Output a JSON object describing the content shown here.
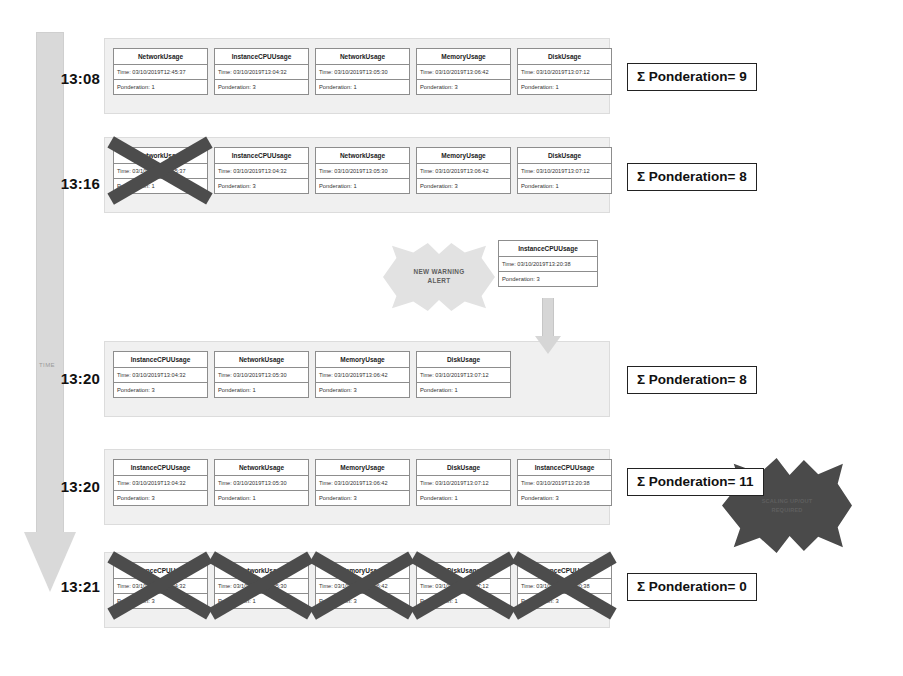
{
  "diagram": {
    "axis": {
      "label": "TIME",
      "ticks": [
        "13:08",
        "13:16",
        "13:20",
        "13:20",
        "13:21"
      ]
    },
    "alert": {
      "warning_label": "NEW WARNING\nALERT",
      "warning_line1": "NEW WARNING",
      "warning_line2": "ALERT",
      "scaling_line1": "SCALING UP/OUT",
      "scaling_line2": "REQUIRED"
    },
    "incoming_event": {
      "title": "InstanceCPUUsage",
      "time": "Time: 03/10/2019T13:20:38",
      "ponderation": "Ponderation: 3"
    },
    "rows": [
      {
        "time": "13:08",
        "sum_label": "Σ Ponderation= 9",
        "cards": [
          {
            "title": "NetworkUsage",
            "time": "Time: 03/10/2019T12:45:37",
            "ponderation": "Ponderation: 1",
            "crossed": false
          },
          {
            "title": "InstanceCPUUsage",
            "time": "Time: 03/10/2019T13:04:32",
            "ponderation": "Ponderation: 3",
            "crossed": false
          },
          {
            "title": "NetworkUsage",
            "time": "Time: 03/10/2019T13:05:30",
            "ponderation": "Ponderation: 1",
            "crossed": false
          },
          {
            "title": "MemoryUsage",
            "time": "Time: 03/10/2019T13:06:42",
            "ponderation": "Ponderation: 3",
            "crossed": false
          },
          {
            "title": "DiskUsage",
            "time": "Time: 03/10/2019T13:07:12",
            "ponderation": "Ponderation: 1",
            "crossed": false
          }
        ]
      },
      {
        "time": "13:16",
        "sum_label": "Σ Ponderation= 8",
        "cards": [
          {
            "title": "NetworkUsage",
            "time": "Time: 03/10/2019T12:45:37",
            "ponderation": "Ponderation: 1",
            "crossed": true
          },
          {
            "title": "InstanceCPUUsage",
            "time": "Time: 03/10/2019T13:04:32",
            "ponderation": "Ponderation: 3",
            "crossed": false
          },
          {
            "title": "NetworkUsage",
            "time": "Time: 03/10/2019T13:05:30",
            "ponderation": "Ponderation: 1",
            "crossed": false
          },
          {
            "title": "MemoryUsage",
            "time": "Time: 03/10/2019T13:06:42",
            "ponderation": "Ponderation: 3",
            "crossed": false
          },
          {
            "title": "DiskUsage",
            "time": "Time: 03/10/2019T13:07:12",
            "ponderation": "Ponderation: 1",
            "crossed": false
          }
        ]
      },
      {
        "time": "13:20",
        "sum_label": "Σ Ponderation= 8",
        "cards": [
          {
            "title": "InstanceCPUUsage",
            "time": "Time: 03/10/2019T13:04:32",
            "ponderation": "Ponderation: 3",
            "crossed": false
          },
          {
            "title": "NetworkUsage",
            "time": "Time: 03/10/2019T13:05:30",
            "ponderation": "Ponderation: 1",
            "crossed": false
          },
          {
            "title": "MemoryUsage",
            "time": "Time: 03/10/2019T13:06:42",
            "ponderation": "Ponderation: 3",
            "crossed": false
          },
          {
            "title": "DiskUsage",
            "time": "Time: 03/10/2019T13:07:12",
            "ponderation": "Ponderation: 1",
            "crossed": false
          }
        ]
      },
      {
        "time": "13:20",
        "sum_label": "Σ Ponderation= 11",
        "cards": [
          {
            "title": "InstanceCPUUsage",
            "time": "Time: 03/10/2019T13:04:32",
            "ponderation": "Ponderation: 3",
            "crossed": false
          },
          {
            "title": "NetworkUsage",
            "time": "Time: 03/10/2019T13:05:30",
            "ponderation": "Ponderation: 1",
            "crossed": false
          },
          {
            "title": "MemoryUsage",
            "time": "Time: 03/10/2019T13:06:42",
            "ponderation": "Ponderation: 3",
            "crossed": false
          },
          {
            "title": "DiskUsage",
            "time": "Time: 03/10/2019T13:07:12",
            "ponderation": "Ponderation: 1",
            "crossed": false
          },
          {
            "title": "InstanceCPUUsage",
            "time": "Time: 03/10/2019T13:20:38",
            "ponderation": "Ponderation: 3",
            "crossed": false
          }
        ]
      },
      {
        "time": "13:21",
        "sum_label": "Σ Ponderation= 0",
        "cards": [
          {
            "title": "InstanceCPUUsage",
            "time": "Time: 03/10/2019T13:04:32",
            "ponderation": "Ponderation: 3",
            "crossed": true
          },
          {
            "title": "NetworkUsage",
            "time": "Time: 03/10/2019T13:05:30",
            "ponderation": "Ponderation: 1",
            "crossed": true
          },
          {
            "title": "MemoryUsage",
            "time": "Time: 03/10/2019T13:06:42",
            "ponderation": "Ponderation: 3",
            "crossed": true
          },
          {
            "title": "DiskUsage",
            "time": "Time: 03/10/2019T13:07:12",
            "ponderation": "Ponderation: 1",
            "crossed": true
          },
          {
            "title": "InstanceCPUUsage",
            "time": "Time: 03/10/2019T13:20:38",
            "ponderation": "Ponderation: 3",
            "crossed": true
          }
        ]
      }
    ],
    "colors": {
      "band": "#f0f0f0",
      "axis": "#d9d9d9",
      "cross": "#4c4c4c",
      "burst_dark": "#4a4a4a",
      "burst_light": "#e2e2e2"
    }
  }
}
